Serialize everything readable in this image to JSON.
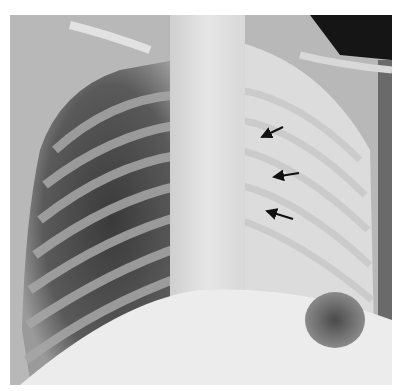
{
  "image": {
    "subject": "Chest radiograph (frontal view)",
    "background_color": "#ffffff",
    "film_bounds": {
      "x": 10,
      "y": 15,
      "width": 382,
      "height": 370
    },
    "annotations": [
      {
        "type": "arrow",
        "from": [
          283,
          127
        ],
        "to": [
          260,
          138
        ]
      },
      {
        "type": "arrow",
        "from": [
          299,
          173
        ],
        "to": [
          272,
          177
        ]
      },
      {
        "type": "arrow",
        "from": [
          293,
          219
        ],
        "to": [
          265,
          210
        ]
      }
    ]
  }
}
